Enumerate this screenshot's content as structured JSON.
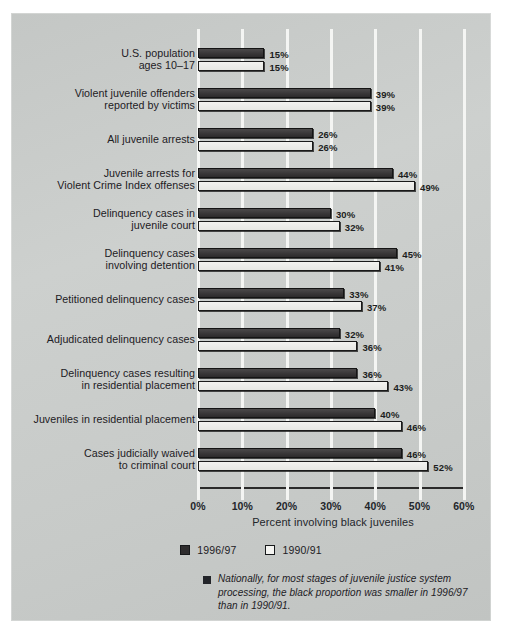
{
  "chart_data": {
    "type": "bar",
    "orientation": "horizontal",
    "title": "",
    "xlabel": "Percent involving black juveniles",
    "ylabel": "",
    "xlim": [
      0,
      60
    ],
    "xtick_labels": [
      "0%",
      "10%",
      "20%",
      "30%",
      "40%",
      "50%",
      "60%"
    ],
    "xticks": [
      0,
      10,
      20,
      30,
      40,
      50,
      60
    ],
    "grid": true,
    "legend_position": "bottom-center",
    "categories": [
      "U.S. population\nages 10–17",
      "Violent juvenile offenders\nreported by victims",
      "All juvenile arrests",
      "Juvenile arrests for\nViolent Crime Index offenses",
      "Delinquency cases in\njuvenile court",
      "Delinquency cases\ninvolving detention",
      "Petitioned delinquency cases",
      "Adjudicated delinquency cases",
      "Delinquency cases resulting\nin residential placement",
      "Juveniles in residential placement",
      "Cases judicially waived\nto criminal court"
    ],
    "series": [
      {
        "name": "1996/97",
        "color": "#2f2d2e",
        "values": [
          15,
          39,
          26,
          44,
          30,
          45,
          33,
          32,
          36,
          40,
          46
        ],
        "labels": [
          "15%",
          "39%",
          "26%",
          "44%",
          "30%",
          "45%",
          "33%",
          "32%",
          "36%",
          "40%",
          "46%"
        ]
      },
      {
        "name": "1990/91",
        "color": "#f4f4f1",
        "values": [
          15,
          39,
          26,
          49,
          32,
          41,
          37,
          36,
          43,
          46,
          52
        ],
        "labels": [
          "15%",
          "39%",
          "26%",
          "49%",
          "32%",
          "41%",
          "37%",
          "36%",
          "43%",
          "46%",
          "52%"
        ]
      }
    ],
    "annotation": "Nationally, for most stages of juvenile justice system processing, the black proportion was smaller in 1996/97 than in 1990/91."
  },
  "legend": {
    "items": [
      {
        "label": "1996/97",
        "swatch": "dark"
      },
      {
        "label": "1990/91",
        "swatch": "light"
      }
    ]
  },
  "footnote": {
    "text": "Nationally, for most stages of juvenile justice system processing, the black proportion was smaller in 1996/97 than in 1990/91."
  }
}
